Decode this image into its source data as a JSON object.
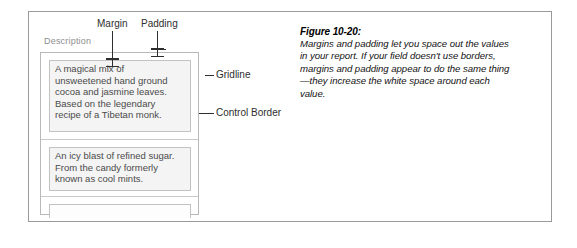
{
  "figure": {
    "caption_title": "Figure 10-20:",
    "caption_body": "Margins and padding let you space out the values in your report. If your field doesn't use borders, margins and padding appear to do the same thing—they increase the white space around each value."
  },
  "screenshot": {
    "column_header": "Description",
    "rows": [
      {
        "value": "A magical mix of\nunsweetened hand ground\ncocoa and jasmine leaves.\nBased on the legendary\nrecipe of a Tibetan monk."
      },
      {
        "value": "An icy blast of refined sugar.\nFrom the candy formerly\nknown as cool mints."
      },
      {
        "value": ""
      }
    ]
  },
  "annotations": {
    "margin_label": "Margin",
    "padding_label": "Padding",
    "gridline_label": "Gridline",
    "control_border_label": "Control Border"
  },
  "colors": {
    "frame_border": "#9a9a9a",
    "control_border": "#b9b9b9",
    "gridline": "#c9c9c9",
    "cell_fill": "#f4f4f4",
    "cell_border": "#c2c2c2",
    "annotation_ink": "#2e2e2e",
    "header_text": "#8e8e8e",
    "body_text": "#4a4a4a"
  }
}
